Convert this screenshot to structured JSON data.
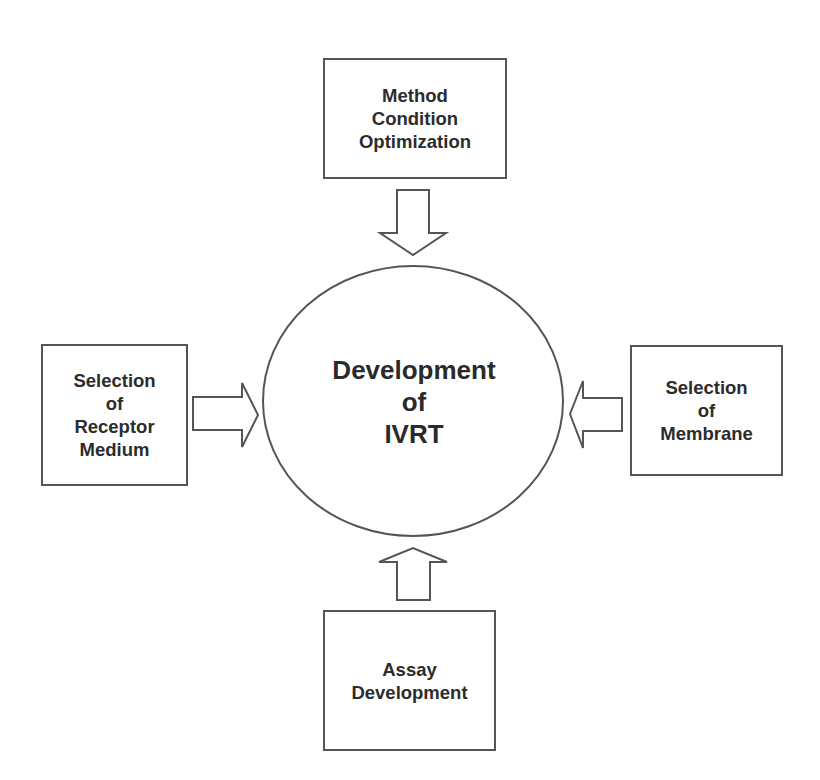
{
  "diagram": {
    "center": {
      "lines": [
        "Development",
        "of",
        "IVRT"
      ]
    },
    "inputs": {
      "top": {
        "lines": [
          "Method",
          "Condition",
          "Optimization"
        ]
      },
      "left": {
        "lines": [
          "Selection",
          "of",
          "Receptor",
          "Medium"
        ]
      },
      "right": {
        "lines": [
          "Selection",
          "of",
          "Membrane"
        ]
      },
      "bottom": {
        "lines": [
          "Assay",
          "Development"
        ]
      }
    },
    "colors": {
      "stroke": "#555555",
      "text": "#2a2a2a",
      "background": "#ffffff"
    }
  }
}
